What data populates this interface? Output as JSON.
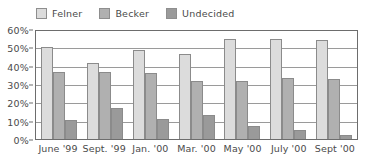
{
  "chart_data": {
    "type": "bar",
    "title": "",
    "subtitle": "",
    "xlabel": "",
    "ylabel": "",
    "ylim": [
      0,
      60
    ],
    "ytick_labels": [
      "60%",
      "50%",
      "40%",
      "30%",
      "20%",
      "10%",
      "0%"
    ],
    "ytick_values": [
      60,
      50,
      40,
      30,
      20,
      10,
      0
    ],
    "grid": true,
    "legend_position": "top-left",
    "categories": [
      "June '99",
      "Sept. '99",
      "Jan. '00",
      "Mar. '00",
      "May '00",
      "July '00",
      "Sept '00"
    ],
    "series": [
      {
        "name": "Felner",
        "color": "#dcdcdc",
        "values": [
          51,
          42.5,
          49.5,
          47,
          55.5,
          55.5,
          55
        ]
      },
      {
        "name": "Becker",
        "color": "#b0b0b0",
        "values": [
          37.5,
          37,
          36.5,
          32.5,
          32.5,
          34,
          33.5
        ]
      },
      {
        "name": "Undecided",
        "color": "#9a9a9a",
        "values": [
          10.5,
          17,
          11,
          13.5,
          7,
          5,
          2.5
        ]
      }
    ]
  }
}
